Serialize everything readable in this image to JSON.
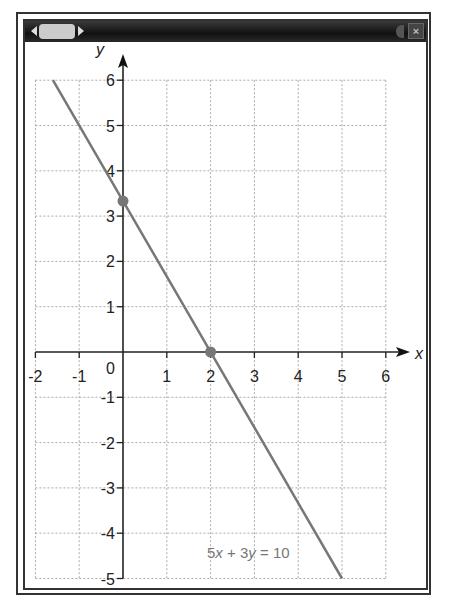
{
  "window": {
    "close_label": "×",
    "scroll_left_icon": "triangle-left",
    "scroll_right_icon": "triangle-right",
    "speaker_icon": "speaker"
  },
  "chart_data": {
    "type": "line",
    "title": "",
    "xlabel": "x",
    "ylabel": "y",
    "xlim": [
      -2,
      6
    ],
    "ylim": [
      -5,
      6
    ],
    "grid": true,
    "x_ticks": [
      "-2",
      "-1",
      "0",
      "1",
      "2",
      "3",
      "4",
      "5",
      "6"
    ],
    "y_ticks": [
      "-5",
      "-4",
      "-3",
      "-2",
      "-1",
      "1",
      "2",
      "3",
      "4",
      "5",
      "6"
    ],
    "origin_label": "0",
    "series": [
      {
        "name": "5x + 3y = 10",
        "x": [
          -1.6,
          5
        ],
        "y": [
          6,
          -5
        ],
        "color": "#777777"
      }
    ],
    "points": [
      {
        "label": "y-intercept",
        "x": 0,
        "y": 3.333
      },
      {
        "label": "x-intercept",
        "x": 2,
        "y": 0
      }
    ],
    "annotation": {
      "text_parts": [
        "5",
        "x",
        " + 3",
        "y",
        " = 10"
      ]
    }
  }
}
